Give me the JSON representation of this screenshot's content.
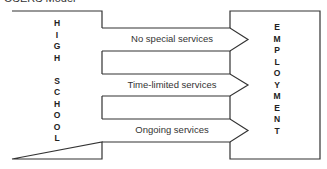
{
  "title": "OSERS Model",
  "left_box": {
    "label": "HIGH SCHOOL",
    "letters": [
      "H",
      "I",
      "G",
      "H",
      "",
      "S",
      "C",
      "H",
      "O",
      "O",
      "L"
    ]
  },
  "right_box": {
    "label": "EMPLOYMENT",
    "letters": [
      "E",
      "M",
      "P",
      "L",
      "O",
      "Y",
      "M",
      "E",
      "N",
      "T"
    ]
  },
  "arrows": [
    {
      "label": "No special services"
    },
    {
      "label": "Time-limited services"
    },
    {
      "label": "Ongoing services"
    }
  ],
  "colors": {
    "stroke": "#333333",
    "background": "#ffffff"
  }
}
